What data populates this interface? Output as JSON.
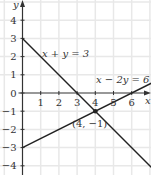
{
  "chart_data": {
    "type": "line",
    "title": "",
    "xlabel": "x",
    "ylabel": "y",
    "xlim": [
      -1.2,
      7.1
    ],
    "ylim": [
      -4.3,
      5.1
    ],
    "grid": true,
    "x_ticks": [
      1,
      2,
      3,
      4,
      5,
      6
    ],
    "y_ticks": [
      4,
      3,
      2,
      1,
      0,
      -1,
      -2,
      -3,
      -4
    ],
    "series": [
      {
        "name": "x + y = 3",
        "equation": "y = 3 - x",
        "points": [
          [
            0,
            3
          ],
          [
            7.1,
            -4.1
          ]
        ]
      },
      {
        "name": "x − 2y = 6",
        "equation": "y = (x - 6) / 2",
        "points": [
          [
            0,
            -3
          ],
          [
            7.1,
            0.55
          ]
        ]
      }
    ],
    "annotations": [
      {
        "text": "(4, −1)",
        "x": 4,
        "y": -1,
        "type": "point"
      }
    ],
    "labels": {
      "x_axis": "x",
      "y_axis": "y",
      "line1": "x + y = 3",
      "line2": "x − 2y = 6",
      "intersection": "(4, −1)"
    },
    "colors": {
      "line": "#222222",
      "axis": "#333333",
      "grid": "#e6e6e6",
      "text": "#333333"
    }
  }
}
